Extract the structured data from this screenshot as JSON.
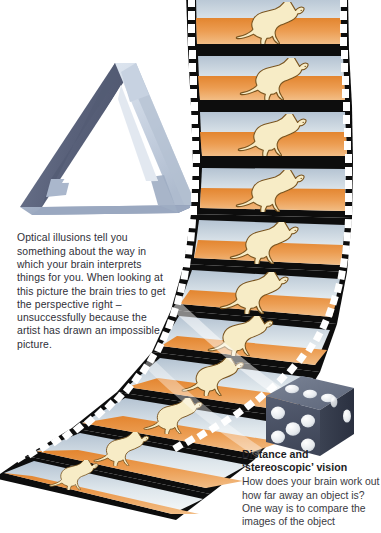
{
  "page": {
    "background_color": "#ffffff",
    "width": 381,
    "height": 533
  },
  "illusion": {
    "figure_name": "penrose-impossible-triangle",
    "text": "Optical illusions tell you something about the way in which your brain interprets things for you. When looking at this picture the brain tries to get the perspective right – unsuccessfully because the artist has drawn an impossible picture.",
    "colors": {
      "face_left_dark": "#5b647c",
      "face_right_light": "#c3cede",
      "face_bottom_mid": "#93a2ba",
      "outline": "#47506a"
    }
  },
  "filmstrip": {
    "figure_name": "curved-film-strip-kangaroo-animation",
    "frame_count": 9,
    "subject": "hopping kangaroo",
    "colors": {
      "film_base": "#0d0d0d",
      "sprocket": "#ffffff",
      "sky_top": "#b9c7d4",
      "sky_bottom": "#f4f6f7",
      "ground_top": "#e8903f",
      "ground_bottom": "#f0b878",
      "kangaroo_fill": "#f6e9bf",
      "kangaroo_outline": "#6b4a1e"
    }
  },
  "dice": {
    "figure_name": "single-die",
    "front_face_value": 5,
    "top_face_value": 3,
    "right_face_value": 2,
    "colors": {
      "front": "#4a5163",
      "top": "#6c7587",
      "right": "#333a49",
      "pip": "#eef1f4"
    }
  },
  "stereo": {
    "heading_line1": "Distance and",
    "heading_line2": "‘stereoscopic’ vision",
    "body": "How does your brain work out how far away an object is? One way is to compare the images of the object"
  }
}
